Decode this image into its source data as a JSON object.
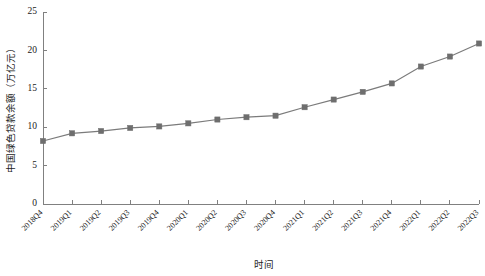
{
  "chart_data": {
    "type": "line",
    "title": "",
    "subtitle": "",
    "xlabel": "时间",
    "ylabel": "中国绿色贷款余额（万亿元）",
    "categories": [
      "2018Q4",
      "2019Q1",
      "2019Q2",
      "2019Q3",
      "2019Q4",
      "2020Q1",
      "2020Q2",
      "2020Q3",
      "2020Q4",
      "2021Q1",
      "2021Q2",
      "2021Q3",
      "2021Q4",
      "2022Q1",
      "2022Q2",
      "2022Q3"
    ],
    "values": [
      8.2,
      9.2,
      9.5,
      9.9,
      10.1,
      10.5,
      11.0,
      11.3,
      11.5,
      12.6,
      13.6,
      14.6,
      15.7,
      17.9,
      19.2,
      20.9
    ],
    "series": [
      {
        "name": "中国绿色贷款余额",
        "values": [
          8.2,
          9.2,
          9.5,
          9.9,
          10.1,
          10.5,
          11.0,
          11.3,
          11.5,
          12.6,
          13.6,
          14.6,
          15.7,
          17.9,
          19.2,
          20.9
        ],
        "color": "#7b7b7b",
        "marker": "square"
      }
    ],
    "ylim": [
      0,
      25
    ],
    "yticks": [
      0,
      5,
      10,
      15,
      20,
      25
    ],
    "ytick_labels": [
      "0",
      "5",
      "10",
      "15",
      "20",
      "25"
    ],
    "grid": false,
    "legend": false,
    "legend_position": "none",
    "line_color": "#7b7b7b",
    "marker_color": "#6e6e6e",
    "axis_color": "#808080",
    "background_color": "#ffffff"
  }
}
